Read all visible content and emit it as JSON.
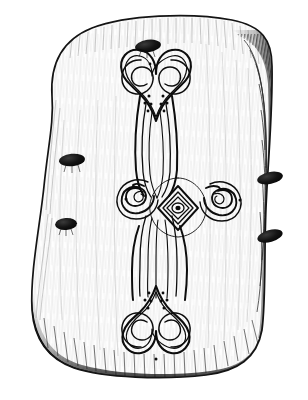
{
  "figure": {
    "title": "Carved stone slab with curvilinear spiral motif",
    "kind": "archaeological line drawing",
    "medium": "pen and ink",
    "canvas": {
      "width": 308,
      "height": 400,
      "background": "#ffffff"
    },
    "palette": {
      "ink": "#0d0d0d",
      "line": "#111111",
      "shading": "#2b2b2b",
      "hatch": "#555555",
      "stone_fill": "#fefefe",
      "mark_fill": "#101010"
    }
  },
  "slab": {
    "name": "stone-slab",
    "description": "irregular rounded rectangular slab, wider at top, tapering slightly, rounded corners",
    "outline_path": "M 52 96 C 50 64 62 40 92 28 C 126 15 190 12 232 20 C 262 26 272 40 272 66 C 273 110 268 160 266 208 C 264 258 266 300 262 330 C 257 358 238 371 206 375 C 164 380 104 378 74 368 C 46 358 34 338 32 310 C 30 272 40 226 44 186 C 48 146 54 122 52 96 Z",
    "edge_shadow_right": "dark hatched shading inside right edge",
    "edge_shadow_bottom": "heavy dark band along bottom edge",
    "edge_shadow_top": "light hatching inside top edge",
    "surface_texture": "fine vertical and diagonal hatching strokes suggesting stone grain"
  },
  "motif": {
    "name": "spiral-cross-motif",
    "description": "vertical double-spiral terminal stem with central lozenge boss and two lateral spiral arms",
    "line_style": "multiple close parallel contour lines",
    "parts": [
      {
        "name": "top-terminal",
        "type": "double-spiral",
        "shape": "heart-shaped pair of inward-curling spirals",
        "cx": 156,
        "cy": 95
      },
      {
        "name": "upper-stem",
        "type": "tapered-band",
        "from_y": 120,
        "to_y": 190
      },
      {
        "name": "center-boss",
        "type": "lozenge",
        "cx": 178,
        "cy": 208,
        "description": "concentric diamond rings around a small oval eye"
      },
      {
        "name": "left-arm-spiral",
        "type": "spiral",
        "cx": 150,
        "cy": 200
      },
      {
        "name": "right-arm-spiral",
        "type": "spiral",
        "cx": 212,
        "cy": 202
      },
      {
        "name": "lower-stem",
        "type": "tapered-band",
        "from_y": 220,
        "to_y": 290
      },
      {
        "name": "bottom-terminal",
        "type": "double-spiral",
        "shape": "inverted heart-shaped pair of inward-curling spirals",
        "cx": 156,
        "cy": 315
      }
    ],
    "dot_clusters": [
      {
        "name": "top-left-dot-cluster",
        "count": 4
      },
      {
        "name": "top-right-dot-cluster",
        "count": 4
      },
      {
        "name": "bottom-left-dot-cluster",
        "count": 4
      },
      {
        "name": "bottom-right-dot-cluster",
        "count": 4
      }
    ],
    "flanking_dots": [
      {
        "name": "left-arm-dot",
        "cx": 127,
        "cy": 199
      },
      {
        "name": "right-arm-dot",
        "cx": 238,
        "cy": 200
      },
      {
        "name": "bottom-terminal-dot",
        "cx": 156,
        "cy": 341
      },
      {
        "name": "top-terminal-dot",
        "cx": 150,
        "cy": 65
      }
    ]
  },
  "damage_marks": [
    {
      "name": "mark-top-center",
      "cx": 148,
      "cy": 46,
      "rx": 13,
      "ry": 6,
      "rotation": -8
    },
    {
      "name": "mark-left-upper",
      "cx": 72,
      "cy": 160,
      "rx": 13,
      "ry": 6,
      "rotation": -6
    },
    {
      "name": "mark-left-lower",
      "cx": 66,
      "cy": 224,
      "rx": 11,
      "ry": 6,
      "rotation": -4
    },
    {
      "name": "mark-right-upper",
      "cx": 270,
      "cy": 178,
      "rx": 13,
      "ry": 6,
      "rotation": -12
    },
    {
      "name": "mark-right-lower",
      "cx": 270,
      "cy": 236,
      "rx": 13,
      "ry": 6,
      "rotation": -16
    }
  ],
  "caption": ""
}
